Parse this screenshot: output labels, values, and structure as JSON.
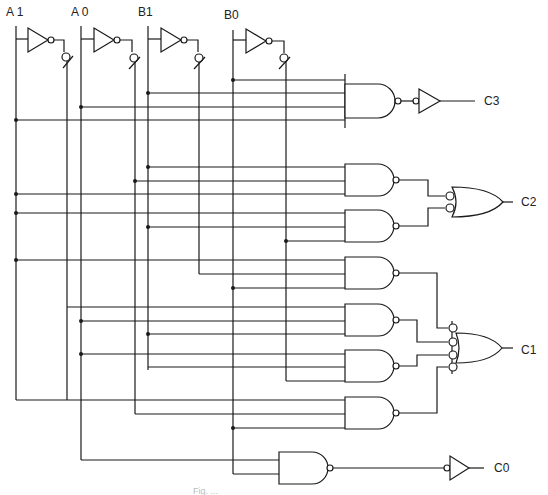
{
  "diagram": {
    "type": "logic-circuit-schematic",
    "inputs": [
      {
        "label": "A 1",
        "x": 16,
        "inv_x": 67
      },
      {
        "label": "A 0",
        "x": 81,
        "inv_x": 135
      },
      {
        "label": "B1",
        "x": 148,
        "inv_x": 199
      },
      {
        "label": "B0",
        "x": 233,
        "inv_x": 286
      }
    ],
    "outputs": [
      {
        "label": "C3",
        "y": 101
      },
      {
        "label": "C2",
        "y": 202
      },
      {
        "label": "C1",
        "y": 350
      },
      {
        "label": "C0",
        "y": 466
      }
    ],
    "gates": [
      {
        "id": "inv-a1",
        "type": "NOT",
        "output_of": "A1"
      },
      {
        "id": "inv-a0",
        "type": "NOT",
        "output_of": "A0"
      },
      {
        "id": "inv-b1",
        "type": "NOT",
        "output_of": "B1"
      },
      {
        "id": "inv-b0",
        "type": "NOT",
        "output_of": "B0"
      },
      {
        "id": "nand-c3",
        "type": "NAND4",
        "inputs": [
          "B0",
          "B1",
          "A0",
          "A1"
        ]
      },
      {
        "id": "buf-c3",
        "type": "INVERTER",
        "drives": "C3"
      },
      {
        "id": "nand-c2a",
        "type": "NAND3",
        "inputs": [
          "B1",
          "A0'",
          "A1"
        ]
      },
      {
        "id": "nand-c2b",
        "type": "NAND3",
        "inputs": [
          "A1",
          "B1",
          "B0'"
        ]
      },
      {
        "id": "or-c2",
        "type": "OR2-negated-inputs",
        "drives": "C2"
      },
      {
        "id": "nand-c1a",
        "type": "NAND3",
        "inputs": [
          "A1",
          "B1'",
          "B0"
        ]
      },
      {
        "id": "nand-c1b",
        "type": "NAND3",
        "inputs": [
          "A1'",
          "A0",
          "B1"
        ]
      },
      {
        "id": "nand-c1c",
        "type": "NAND3",
        "inputs": [
          "A0",
          "B1'",
          "B0'"
        ]
      },
      {
        "id": "nand-c1d",
        "type": "NAND3",
        "inputs": [
          "A1",
          "B1'",
          "B0"
        ]
      },
      {
        "id": "or-c1",
        "type": "OR4-negated-inputs",
        "drives": "C1"
      },
      {
        "id": "nand-c0",
        "type": "NAND2",
        "inputs": [
          "A0",
          "B0"
        ]
      },
      {
        "id": "buf-c0",
        "type": "INVERTER",
        "drives": "C0"
      }
    ],
    "caption": "Fig. ..."
  }
}
